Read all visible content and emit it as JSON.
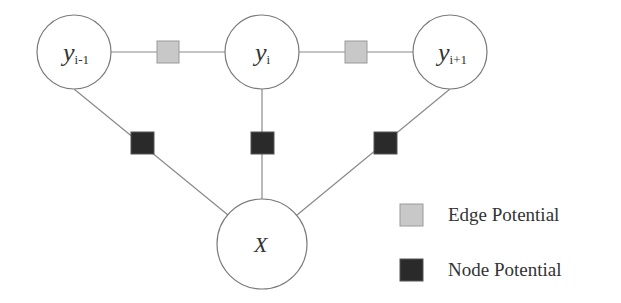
{
  "diagram": {
    "type": "factor-graph",
    "colors": {
      "edge_potential": "#c8c8c8",
      "node_potential": "#2a2a2a",
      "line": "#8a8a8a",
      "circle_stroke": "#7a7a7a"
    },
    "nodes": [
      {
        "id": "y_prev",
        "base": "y",
        "subscript": "i-1"
      },
      {
        "id": "y_cur",
        "base": "y",
        "subscript": "i"
      },
      {
        "id": "y_next",
        "base": "y",
        "subscript": "i+1"
      },
      {
        "id": "x",
        "base": "X",
        "subscript": ""
      }
    ],
    "edge_factors": [
      {
        "between": [
          "y_prev",
          "y_cur"
        ]
      },
      {
        "between": [
          "y_cur",
          "y_next"
        ]
      }
    ],
    "node_factors": [
      {
        "between": [
          "y_prev",
          "x"
        ]
      },
      {
        "between": [
          "y_cur",
          "x"
        ]
      },
      {
        "between": [
          "y_next",
          "x"
        ]
      }
    ]
  },
  "legend": {
    "items": [
      {
        "label": "Edge Potential",
        "swatch": "light-gray-square"
      },
      {
        "label": "Node Potential",
        "swatch": "dark-square"
      }
    ]
  }
}
